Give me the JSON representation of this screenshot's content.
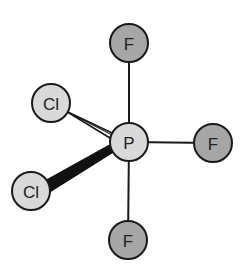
{
  "diagram": {
    "type": "molecule-structure",
    "central_atom": {
      "id": "P",
      "label": "P",
      "x": 129,
      "y": 142,
      "fill": "#d9d9d9"
    },
    "atoms": [
      {
        "id": "F_top",
        "label": "F",
        "x": 129,
        "y": 43,
        "fill": "#a6a6a6"
      },
      {
        "id": "F_right",
        "label": "F",
        "x": 213,
        "y": 143,
        "fill": "#a6a6a6"
      },
      {
        "id": "F_bottom",
        "label": "F",
        "x": 128,
        "y": 240,
        "fill": "#a6a6a6"
      },
      {
        "id": "Cl_upper",
        "label": "Cl",
        "x": 51,
        "y": 103,
        "fill": "#d9d9d9"
      },
      {
        "id": "Cl_lower",
        "label": "Cl",
        "x": 31,
        "y": 191,
        "fill": "#d9d9d9"
      }
    ],
    "bonds": [
      {
        "from": "P",
        "to": "F_top",
        "style": "line"
      },
      {
        "from": "P",
        "to": "F_right",
        "style": "line"
      },
      {
        "from": "P",
        "to": "F_bottom",
        "style": "line"
      },
      {
        "from": "P",
        "to": "Cl_upper",
        "style": "hashed-wedge"
      },
      {
        "from": "P",
        "to": "Cl_lower",
        "style": "solid-wedge"
      }
    ],
    "atom_radius": 19,
    "stroke_color": "#1a1a1a"
  }
}
